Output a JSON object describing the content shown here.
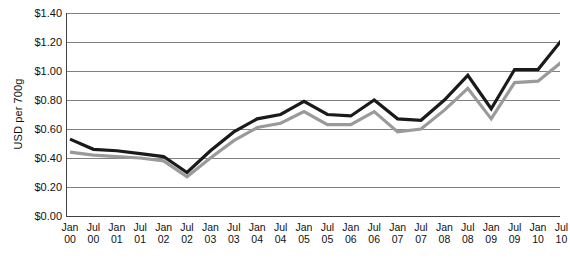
{
  "chart_data": {
    "type": "line",
    "title": "",
    "xlabel": "",
    "ylabel": "USD per 700g",
    "ylim": [
      0.0,
      1.4
    ],
    "ytick_values": [
      0.0,
      0.2,
      0.4,
      0.6,
      0.8,
      1.0,
      1.2,
      1.4
    ],
    "ytick_labels": [
      "$0.00",
      "$0.20",
      "$0.40",
      "$0.60",
      "$0.80",
      "$1.00",
      "$1.20",
      "$1.40"
    ],
    "grid": true,
    "legend": "none",
    "categories": [
      "Jan 00",
      "Jul 00",
      "Jan 01",
      "Jul 01",
      "Jan 02",
      "Jul 02",
      "Jan 03",
      "Jul 03",
      "Jan 04",
      "Jul 04",
      "Jan 05",
      "Jul 05",
      "Jan 06",
      "Jul 06",
      "Jan 07",
      "Jul 07",
      "Jan 08",
      "Jul 08",
      "Jan 09",
      "Jul 09",
      "Jan 10",
      "Jul 10"
    ],
    "xtick_lines": [
      [
        "Jan",
        "00"
      ],
      [
        "Jul",
        "00"
      ],
      [
        "Jan",
        "01"
      ],
      [
        "Jul",
        "01"
      ],
      [
        "Jan",
        "02"
      ],
      [
        "Jul",
        "02"
      ],
      [
        "Jan",
        "03"
      ],
      [
        "Jul",
        "03"
      ],
      [
        "Jan",
        "04"
      ],
      [
        "Jul",
        "04"
      ],
      [
        "Jan",
        "05"
      ],
      [
        "Jul",
        "05"
      ],
      [
        "Jan",
        "06"
      ],
      [
        "Jul",
        "06"
      ],
      [
        "Jan",
        "07"
      ],
      [
        "Jul",
        "07"
      ],
      [
        "Jan",
        "08"
      ],
      [
        "Jul",
        "08"
      ],
      [
        "Jan",
        "09"
      ],
      [
        "Jul",
        "09"
      ],
      [
        "Jan",
        "10"
      ],
      [
        "Jul",
        "10"
      ]
    ],
    "series": [
      {
        "name": "upper-series",
        "color": "#1a1a1a",
        "values": [
          0.53,
          0.46,
          0.45,
          0.43,
          0.41,
          0.3,
          0.45,
          0.58,
          0.67,
          0.7,
          0.79,
          0.7,
          0.69,
          0.8,
          0.67,
          0.66,
          0.8,
          0.97,
          0.74,
          1.01,
          1.01,
          1.21
        ]
      },
      {
        "name": "lower-series",
        "color": "#9a9a9a",
        "values": [
          0.44,
          0.42,
          0.41,
          0.4,
          0.38,
          0.27,
          0.4,
          0.52,
          0.61,
          0.64,
          0.72,
          0.63,
          0.63,
          0.72,
          0.58,
          0.6,
          0.73,
          0.88,
          0.67,
          0.92,
          0.93,
          1.06
        ]
      }
    ],
    "colors": {
      "grid": "#808080",
      "axis": "#404040",
      "text": "#111111",
      "series_upper": "#1a1a1a",
      "series_lower": "#9a9a9a"
    }
  }
}
